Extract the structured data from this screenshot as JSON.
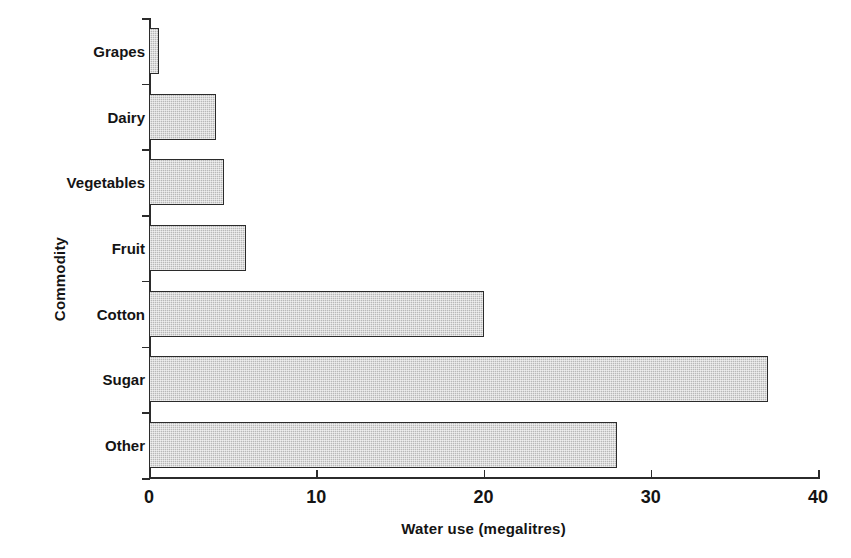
{
  "chart_data": {
    "type": "bar",
    "orientation": "horizontal",
    "title": "",
    "xlabel": "Water use (megalitres)",
    "ylabel": "Commodity",
    "categories": [
      "Grapes",
      "Dairy",
      "Vegetables",
      "Fruit",
      "Cotton",
      "Sugar",
      "Other"
    ],
    "values": [
      0.6,
      4.0,
      4.5,
      5.8,
      20.0,
      37.0,
      28.0
    ],
    "xlim": [
      0,
      40
    ],
    "xticks": [
      0,
      10,
      20,
      30,
      40
    ],
    "xtick_labels": [
      "0",
      "10",
      "20",
      "30",
      "40"
    ],
    "grid": false,
    "legend": null,
    "bar_fill": "#b8b8b8",
    "bar_edge": "#2b2b2b",
    "axis_color": "#2b2b2b",
    "background": "#ffffff"
  }
}
